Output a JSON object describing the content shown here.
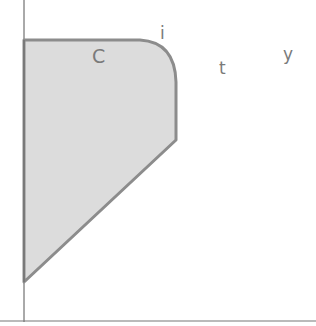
{
  "diagram": {
    "region_label": "C",
    "point_labels": [
      "i",
      "t",
      "y"
    ],
    "colors": {
      "fill": "#dcdcdc",
      "stroke": "#8c8c8c",
      "axis": "#555555",
      "label": "#7a7a7a"
    }
  }
}
